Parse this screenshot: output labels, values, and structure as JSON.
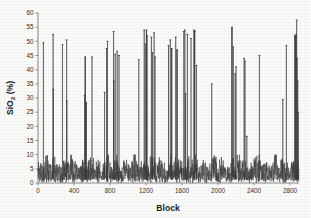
{
  "chart_data": {
    "type": "line",
    "title": "",
    "subtitle": "",
    "xlabel": "Block",
    "ylabel": "SiO2 (%)",
    "ylabel_parts": {
      "pre": "SiO",
      "sub": "2",
      "post": " (%)"
    },
    "xlim": [
      0,
      2900
    ],
    "ylim": [
      0,
      60
    ],
    "xticks": [
      0,
      400,
      800,
      1200,
      1600,
      2000,
      2400,
      2800
    ],
    "yticks": [
      0,
      5,
      10,
      15,
      20,
      25,
      30,
      35,
      40,
      45,
      50,
      55,
      60
    ],
    "xtick_labels": [
      "0",
      "400",
      "800",
      "1200",
      "1600",
      "2000",
      "2400",
      "2800"
    ],
    "ytick_labels": [
      "0",
      "5",
      "10",
      "15",
      "20",
      "25",
      "30",
      "35",
      "40",
      "45",
      "50",
      "55",
      "60"
    ],
    "grid": false,
    "legend": null,
    "legend_position": "none",
    "series_color": "#3a3a3a",
    "series_name": "SiO2",
    "baseline_range": [
      0,
      10
    ],
    "baseline_mean": 5.5,
    "spikes": [
      {
        "x": 60,
        "y": 49.5
      },
      {
        "x": 168,
        "y": 52.5
      },
      {
        "x": 170,
        "y": 33.0
      },
      {
        "x": 272,
        "y": 48.8
      },
      {
        "x": 318,
        "y": 50.5
      },
      {
        "x": 320,
        "y": 29.0
      },
      {
        "x": 520,
        "y": 31.0
      },
      {
        "x": 525,
        "y": 44.5
      },
      {
        "x": 535,
        "y": 28.5
      },
      {
        "x": 600,
        "y": 44.5
      },
      {
        "x": 740,
        "y": 32.0
      },
      {
        "x": 762,
        "y": 47.5
      },
      {
        "x": 772,
        "y": 50.0
      },
      {
        "x": 840,
        "y": 53.5
      },
      {
        "x": 842,
        "y": 36.0
      },
      {
        "x": 858,
        "y": 45.5
      },
      {
        "x": 880,
        "y": 46.5
      },
      {
        "x": 900,
        "y": 45.0
      },
      {
        "x": 1120,
        "y": 43.5
      },
      {
        "x": 1180,
        "y": 54.0
      },
      {
        "x": 1192,
        "y": 49.0
      },
      {
        "x": 1205,
        "y": 54.0
      },
      {
        "x": 1212,
        "y": 52.0
      },
      {
        "x": 1260,
        "y": 51.5
      },
      {
        "x": 1272,
        "y": 46.0
      },
      {
        "x": 1290,
        "y": 53.0
      },
      {
        "x": 1300,
        "y": 44.5
      },
      {
        "x": 1450,
        "y": 48.5
      },
      {
        "x": 1470,
        "y": 50.5
      },
      {
        "x": 1485,
        "y": 47.5
      },
      {
        "x": 1530,
        "y": 51.5
      },
      {
        "x": 1545,
        "y": 47.0
      },
      {
        "x": 1620,
        "y": 53.5
      },
      {
        "x": 1632,
        "y": 54.0
      },
      {
        "x": 1640,
        "y": 31.5
      },
      {
        "x": 1660,
        "y": 52.5
      },
      {
        "x": 1700,
        "y": 51.0
      },
      {
        "x": 1735,
        "y": 54.0
      },
      {
        "x": 1742,
        "y": 53.5
      },
      {
        "x": 1760,
        "y": 41.5
      },
      {
        "x": 1930,
        "y": 35.0
      },
      {
        "x": 2155,
        "y": 55.0
      },
      {
        "x": 2170,
        "y": 48.0
      },
      {
        "x": 2190,
        "y": 38.5
      },
      {
        "x": 2200,
        "y": 41.0
      },
      {
        "x": 2290,
        "y": 44.0
      },
      {
        "x": 2300,
        "y": 43.0
      },
      {
        "x": 2320,
        "y": 16.5
      },
      {
        "x": 2460,
        "y": 45.0
      },
      {
        "x": 2720,
        "y": 29.5
      },
      {
        "x": 2760,
        "y": 48.5
      },
      {
        "x": 2855,
        "y": 52.0
      },
      {
        "x": 2862,
        "y": 51.5
      },
      {
        "x": 2868,
        "y": 52.5
      },
      {
        "x": 2874,
        "y": 57.5
      },
      {
        "x": 2880,
        "y": 44.0
      },
      {
        "x": 2886,
        "y": 36.0
      },
      {
        "x": 2892,
        "y": 25.0
      }
    ]
  }
}
